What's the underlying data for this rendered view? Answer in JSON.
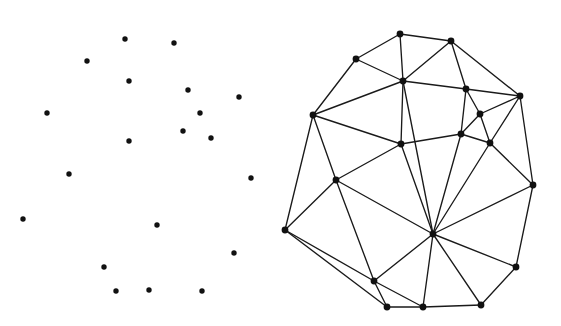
{
  "figure": {
    "width": 561,
    "height": 326,
    "background": "#ffffff",
    "ink_color": "#1a1a1a",
    "dot_color": "#111111"
  },
  "panels": [
    {
      "id": "left-panel",
      "name": "point-set-panel",
      "description": "scattered point set without edges",
      "point_radius": 2.7,
      "point_count": 20,
      "points": [
        {
          "id": "p1",
          "x": 125,
          "y": 39
        },
        {
          "id": "p2",
          "x": 174,
          "y": 43
        },
        {
          "id": "p3",
          "x": 87,
          "y": 61
        },
        {
          "id": "p4",
          "x": 129,
          "y": 81
        },
        {
          "id": "p5",
          "x": 188,
          "y": 90
        },
        {
          "id": "p6",
          "x": 239,
          "y": 97
        },
        {
          "id": "p7",
          "x": 47,
          "y": 113
        },
        {
          "id": "p8",
          "x": 200,
          "y": 113
        },
        {
          "id": "p9",
          "x": 183,
          "y": 131
        },
        {
          "id": "p10",
          "x": 129,
          "y": 141
        },
        {
          "id": "p11",
          "x": 211,
          "y": 138
        },
        {
          "id": "p12",
          "x": 69,
          "y": 174
        },
        {
          "id": "p13",
          "x": 251,
          "y": 178
        },
        {
          "id": "p14",
          "x": 23,
          "y": 219
        },
        {
          "id": "p15",
          "x": 157,
          "y": 225
        },
        {
          "id": "p16",
          "x": 234,
          "y": 253
        },
        {
          "id": "p17",
          "x": 104,
          "y": 267
        },
        {
          "id": "p18",
          "x": 116,
          "y": 291
        },
        {
          "id": "p19",
          "x": 149,
          "y": 290
        },
        {
          "id": "p20",
          "x": 202,
          "y": 291
        }
      ]
    },
    {
      "id": "right-panel",
      "name": "triangulation-panel",
      "description": "triangulated planar graph over the same style point set",
      "vertex_radius": 3.4,
      "vertex_count": 20,
      "edge_count": 45,
      "vertices": [
        {
          "id": "v1",
          "x": 400,
          "y": 34
        },
        {
          "id": "v2",
          "x": 451,
          "y": 41
        },
        {
          "id": "v3",
          "x": 356,
          "y": 59
        },
        {
          "id": "v4",
          "x": 403,
          "y": 81
        },
        {
          "id": "v5",
          "x": 466,
          "y": 89
        },
        {
          "id": "v6",
          "x": 520,
          "y": 96
        },
        {
          "id": "v7",
          "x": 313,
          "y": 115
        },
        {
          "id": "v8",
          "x": 480,
          "y": 114
        },
        {
          "id": "v9",
          "x": 461,
          "y": 134
        },
        {
          "id": "v10",
          "x": 401,
          "y": 144
        },
        {
          "id": "v11",
          "x": 490,
          "y": 143
        },
        {
          "id": "v12",
          "x": 336,
          "y": 180
        },
        {
          "id": "v13",
          "x": 533,
          "y": 185
        },
        {
          "id": "v14",
          "x": 285,
          "y": 230
        },
        {
          "id": "v15",
          "x": 433,
          "y": 234
        },
        {
          "id": "v16",
          "x": 516,
          "y": 267
        },
        {
          "id": "v17",
          "x": 374,
          "y": 281
        },
        {
          "id": "v18",
          "x": 481,
          "y": 305
        },
        {
          "id": "v19",
          "x": 387,
          "y": 307
        },
        {
          "id": "v20",
          "x": 423,
          "y": 307
        }
      ],
      "edges": [
        [
          "v1",
          "v2"
        ],
        [
          "v1",
          "v3"
        ],
        [
          "v1",
          "v4"
        ],
        [
          "v2",
          "v4"
        ],
        [
          "v2",
          "v5"
        ],
        [
          "v2",
          "v6"
        ],
        [
          "v3",
          "v4"
        ],
        [
          "v3",
          "v7"
        ],
        [
          "v4",
          "v5"
        ],
        [
          "v4",
          "v7"
        ],
        [
          "v4",
          "v10"
        ],
        [
          "v4",
          "v15"
        ],
        [
          "v5",
          "v6"
        ],
        [
          "v5",
          "v8"
        ],
        [
          "v5",
          "v9"
        ],
        [
          "v6",
          "v8"
        ],
        [
          "v6",
          "v11"
        ],
        [
          "v6",
          "v13"
        ],
        [
          "v7",
          "v10"
        ],
        [
          "v7",
          "v12"
        ],
        [
          "v7",
          "v14"
        ],
        [
          "v8",
          "v9"
        ],
        [
          "v8",
          "v11"
        ],
        [
          "v9",
          "v10"
        ],
        [
          "v9",
          "v11"
        ],
        [
          "v9",
          "v15"
        ],
        [
          "v10",
          "v12"
        ],
        [
          "v10",
          "v15"
        ],
        [
          "v11",
          "v13"
        ],
        [
          "v11",
          "v15"
        ],
        [
          "v12",
          "v14"
        ],
        [
          "v12",
          "v15"
        ],
        [
          "v12",
          "v17"
        ],
        [
          "v13",
          "v15"
        ],
        [
          "v13",
          "v16"
        ],
        [
          "v14",
          "v17"
        ],
        [
          "v14",
          "v19"
        ],
        [
          "v15",
          "v16"
        ],
        [
          "v15",
          "v17"
        ],
        [
          "v15",
          "v18"
        ],
        [
          "v15",
          "v20"
        ],
        [
          "v16",
          "v18"
        ],
        [
          "v17",
          "v19"
        ],
        [
          "v17",
          "v20"
        ],
        [
          "v19",
          "v20"
        ],
        [
          "v20",
          "v18"
        ]
      ]
    }
  ]
}
